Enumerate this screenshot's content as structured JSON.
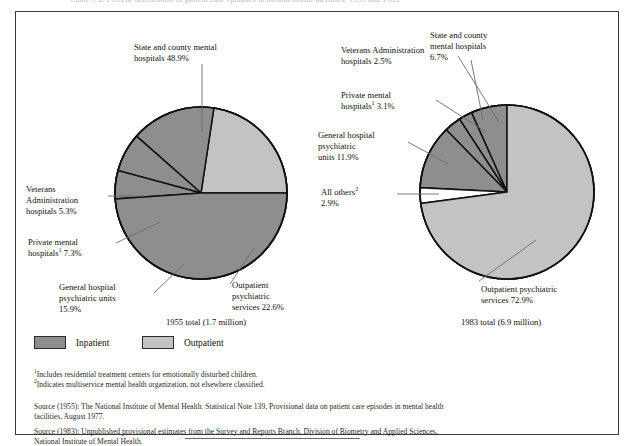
{
  "figure": {
    "top_cut_text": "Chart 5-2.  Percent distribution of patient care episodes in mental health facilities, 1955 and 1983",
    "legend": [
      {
        "label": "Inpatient",
        "color": "#8e8e8e"
      },
      {
        "label": "Outpatient",
        "color": "#c3c3c3"
      }
    ],
    "footnotes": [
      {
        "marker": "1",
        "text": "Includes residential treatment centers for emotionally disturbed children."
      },
      {
        "marker": "2",
        "text": "Indicates multiservice mental health organization, not elsewhere classified."
      }
    ],
    "sources": [
      {
        "lines": [
          "Source (1955):  The National Institute of Mental Health.  Statistical Note 139, Provisional data on patient care episodes in mental health",
          "facilities, August 1977."
        ]
      },
      {
        "lines": [
          "Source (1983):  Unpublished provisional estimates from the Survey and Reports Branch, Division of Biometry and Applied Sciences,",
          "National Institute of Mental Health."
        ]
      }
    ]
  },
  "chart_data": [
    {
      "type": "pie",
      "id": "pie-1955",
      "title": "1955 total (1.7 million)",
      "total_label": "1.7 million",
      "year": "1955",
      "start_angle_deg": 0,
      "direction": "counterclockwise",
      "radius_px": 86,
      "center_px": [
        185,
        181
      ],
      "legend_position": "below-charts",
      "grid": false,
      "slices": [
        {
          "name": "Outpatient psychiatric services",
          "value": 22.6,
          "label": "Outpatient\npsychiatric\nservices 22.6%",
          "category": "Outpatient",
          "color": "#c3c3c3"
        },
        {
          "name": "General hospital psychiatric units",
          "value": 15.9,
          "label": "General hospital\npsychiatric units\n15.9%",
          "category": "Inpatient",
          "color": "#8e8e8e"
        },
        {
          "name": "Private mental hospitals",
          "value": 7.3,
          "label": "Private mental\nhospitals(1) 7.3%",
          "category": "Inpatient",
          "color": "#8e8e8e",
          "footnote": "1"
        },
        {
          "name": "Veterans Administration hospitals",
          "value": 5.3,
          "label": "Veterans\nAdministration\nhospitals 5.3%",
          "category": "Inpatient",
          "color": "#8e8e8e"
        },
        {
          "name": "State and county mental hospitals",
          "value": 48.9,
          "label": "State and county mental\nhospitals 48.9%",
          "category": "Inpatient",
          "color": "#8e8e8e"
        }
      ]
    },
    {
      "type": "pie",
      "id": "pie-1983",
      "title": "1983 total (6.9 million)",
      "total_label": "6.9 million",
      "year": "1983",
      "start_angle_deg": 90,
      "direction": "counterclockwise",
      "radius_px": 87,
      "center_px": [
        491,
        180
      ],
      "legend_position": "below-charts",
      "grid": false,
      "slices": [
        {
          "name": "State and county mental hospitals",
          "value": 6.7,
          "label": "State and county\nmental hospitals\n6.7%",
          "category": "Inpatient",
          "color": "#8e8e8e"
        },
        {
          "name": "Veterans Administration hospitals",
          "value": 2.5,
          "label": "Veterans Administration\nhospitals 2.5%",
          "category": "Inpatient",
          "color": "#8e8e8e"
        },
        {
          "name": "Private mental hospitals",
          "value": 3.1,
          "label": "Private mental\nhospitals(1) 3.1%",
          "category": "Inpatient",
          "color": "#8e8e8e",
          "footnote": "1"
        },
        {
          "name": "General hospital psychiatric units",
          "value": 11.9,
          "label": "General hospital\npsychiatric\nunits 11.9%",
          "category": "Inpatient",
          "color": "#8e8e8e"
        },
        {
          "name": "All others",
          "value": 2.9,
          "label": "All others(2)\n2.9%",
          "category": "Other",
          "color": "#ffffff",
          "footnote": "2"
        },
        {
          "name": "Outpatient psychiatric services",
          "value": 72.9,
          "label": "Outpatient psychiatric\nservices 72.9%",
          "category": "Outpatient",
          "color": "#c3c3c3"
        }
      ]
    }
  ],
  "labels": {
    "left": {
      "state": {
        "l1": "State and county mental",
        "l2": "hospitals 48.9%"
      },
      "vet": {
        "l1": "Veterans",
        "l2": "Administration",
        "l3": "hospitals 5.3%"
      },
      "priv": {
        "l1": "Private mental",
        "l2a": "hospitals",
        "fn": "1",
        "l2b": " 7.3%"
      },
      "genhosp": {
        "l1": "General hospital",
        "l2": "psychiatric units",
        "l3": "15.9%"
      },
      "outp": {
        "l1": "Outpatient",
        "l2": "psychiatric",
        "l3": "services 22.6%"
      },
      "caption": "1955 total (1.7 million)"
    },
    "right": {
      "state": {
        "l1": "State and county",
        "l2": "mental hospitals",
        "l3": "6.7%"
      },
      "vet": {
        "l1": "Veterans Administration",
        "l2": "hospitals 2.5%"
      },
      "priv": {
        "l1": "Private mental",
        "l2a": "hospitals",
        "fn": "1",
        "l2b": " 3.1%"
      },
      "genhosp": {
        "l1": "General hospital",
        "l2": "psychiatric",
        "l3": "units 11.9%"
      },
      "allo": {
        "l1a": "All others",
        "fn": "2",
        "l2": "2.9%"
      },
      "outp": {
        "l1": "Outpatient psychiatric",
        "l2": "services 72.9%"
      },
      "caption": "1983 total (6.9 million)"
    }
  },
  "colors": {
    "inpatient": "#8e8e8e",
    "outpatient": "#c3c3c3",
    "other": "#ffffff",
    "outline": "#111111",
    "frame": "#3a3a3a",
    "leader": "#6b6b6b"
  }
}
